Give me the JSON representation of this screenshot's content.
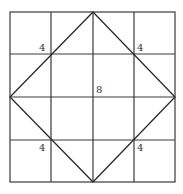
{
  "diagram": {
    "grid": {
      "rows": 4,
      "cols": 4,
      "x_lines": [
        10,
        51,
        93,
        134,
        175
      ],
      "y_lines": [
        12,
        54,
        97,
        140,
        182
      ],
      "line_color": "#3a3a3a"
    },
    "diamond": {
      "vertices": [
        [
          93,
          12
        ],
        [
          175,
          97
        ],
        [
          93,
          182
        ],
        [
          10,
          97
        ]
      ],
      "line_color": "#2a2a2a"
    },
    "labels": {
      "top_left": "4",
      "top_right": "4",
      "center": "8",
      "bottom_left": "4",
      "bottom_right": "4"
    }
  }
}
